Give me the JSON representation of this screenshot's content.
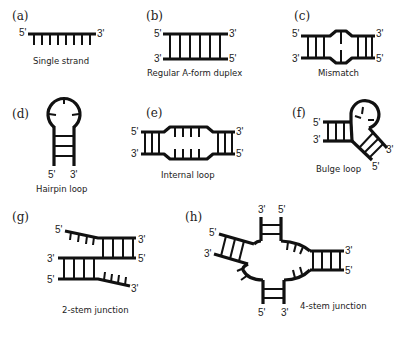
{
  "figure": {
    "background": "#ffffff",
    "stroke_color": "#111111",
    "panels": [
      {
        "id": "a",
        "label": "(a)",
        "caption": "Single strand",
        "ends": {
          "left": "5'",
          "right": "3'"
        },
        "bases": 8
      },
      {
        "id": "b",
        "label": "(b)",
        "caption": "Regular  A-form  duplex",
        "ends": {
          "top_left": "5'",
          "top_right": "3'",
          "bottom_left": "3'",
          "bottom_right": "5'"
        },
        "base_pairs": 6
      },
      {
        "id": "c",
        "label": "(c)",
        "caption": "Mismatch",
        "ends": {
          "top_left": "5'",
          "top_right": "3'",
          "bottom_left": "3'",
          "bottom_right": "5'"
        }
      },
      {
        "id": "d",
        "label": "(d)",
        "caption": "Hairpin  loop",
        "ends": {
          "left": "5'",
          "right": "3'"
        }
      },
      {
        "id": "e",
        "label": "(e)",
        "caption": "Internal  loop",
        "ends": {
          "top_left": "5'",
          "top_right": "3'",
          "bottom_left": "3'",
          "bottom_right": "5'"
        }
      },
      {
        "id": "f",
        "label": "(f)",
        "caption": "Bulge loop",
        "ends": {
          "top_left": "5'",
          "bottom_left": "3'",
          "arm_3": "3'",
          "arm_5": "5'"
        }
      },
      {
        "id": "g",
        "label": "(g)",
        "caption": "2-stem   junction",
        "ends": {
          "top_left": "5'",
          "top_right": "3'",
          "mid_left": "3'",
          "mid_right": "5'",
          "bottom_left": "5'",
          "bottom_right": "3'"
        }
      },
      {
        "id": "h",
        "label": "(h)",
        "caption": "4-stem   junction",
        "ends": {
          "top_left": "3'",
          "top_right": "5'",
          "left_upper": "5'",
          "left_lower": "3'",
          "right_upper": "3'",
          "right_lower": "5'",
          "bottom_left": "5'",
          "bottom_right": "3'"
        }
      }
    ]
  }
}
